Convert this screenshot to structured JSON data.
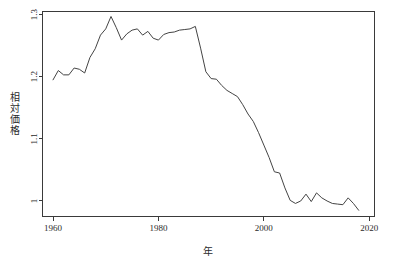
{
  "chart_data": {
    "type": "line",
    "title": "",
    "subtitle": "",
    "xlabel": "年",
    "ylabel": "相対価格",
    "xlim": [
      1958,
      2021
    ],
    "ylim": [
      0.975,
      1.305
    ],
    "grid": false,
    "legend": null,
    "xticks": [
      1960,
      1980,
      2000,
      2020
    ],
    "xtick_labels": [
      "1960",
      "1980",
      "2000",
      "2020"
    ],
    "yticks": [
      1,
      1.1,
      1.2,
      1.3
    ],
    "ytick_labels": [
      "1",
      "1.1",
      "1.2",
      "1.3"
    ],
    "series": [
      {
        "name": "相対価格",
        "color": "#444444",
        "x": [
          1960,
          1961,
          1962,
          1963,
          1964,
          1965,
          1966,
          1967,
          1968,
          1969,
          1970,
          1971,
          1972,
          1973,
          1974,
          1975,
          1976,
          1977,
          1978,
          1979,
          1980,
          1981,
          1982,
          1983,
          1984,
          1985,
          1986,
          1987,
          1988,
          1989,
          1990,
          1991,
          1992,
          1993,
          1994,
          1995,
          1996,
          1997,
          1998,
          1999,
          2000,
          2001,
          2002,
          2003,
          2004,
          2005,
          2006,
          2007,
          2008,
          2009,
          2010,
          2011,
          2012,
          2013,
          2014,
          2015,
          2016,
          2017,
          2018
        ],
        "values": [
          1.195,
          1.21,
          1.203,
          1.203,
          1.214,
          1.212,
          1.206,
          1.231,
          1.245,
          1.267,
          1.277,
          1.297,
          1.279,
          1.259,
          1.269,
          1.275,
          1.277,
          1.267,
          1.273,
          1.262,
          1.259,
          1.268,
          1.271,
          1.272,
          1.275,
          1.276,
          1.277,
          1.281,
          1.246,
          1.208,
          1.197,
          1.196,
          1.186,
          1.178,
          1.173,
          1.168,
          1.155,
          1.14,
          1.128,
          1.11,
          1.09,
          1.07,
          1.047,
          1.045,
          1.021,
          1.001,
          0.996,
          1.0,
          1.011,
          0.999,
          1.013,
          1.005,
          1.0,
          0.996,
          0.995,
          0.994,
          1.005,
          0.996,
          0.985
        ]
      }
    ],
    "annotations": []
  },
  "axis": {
    "y_label_chars": [
      "相",
      "対",
      "価",
      "格"
    ]
  },
  "colors": {
    "line": "#444444",
    "axis": "#3a3a3a",
    "text": "#2b2b2b",
    "background": "#ffffff"
  }
}
